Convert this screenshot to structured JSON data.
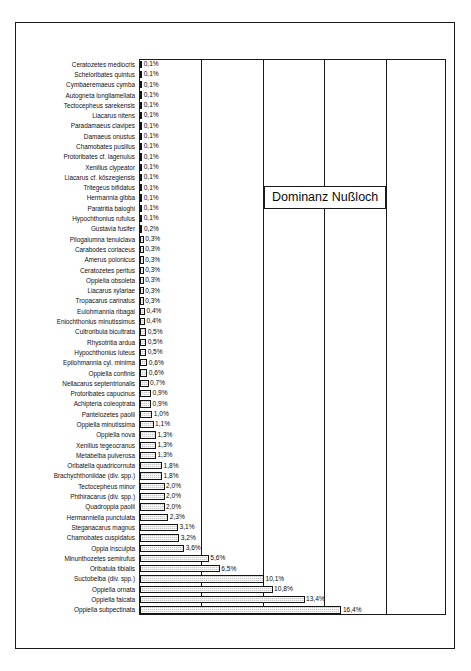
{
  "figure": {
    "title": "Dominanz Nußloch",
    "caption": ""
  },
  "chart_data": {
    "type": "bar",
    "orientation": "horizontal",
    "title": "Dominanz Nußloch",
    "xlabel": "",
    "ylabel": "",
    "xlim": [
      0,
      25
    ],
    "xticks": [
      0,
      5,
      10,
      15,
      20,
      25
    ],
    "grid": true,
    "legend": false,
    "value_suffix": "%",
    "decimal_separator": ",",
    "categories": [
      "Ceratozetes mediocris",
      "Scheloribates quintus",
      "Cymbaeremaeus cymba",
      "Autogneta longilamellata",
      "Tectocepheus sarekensis",
      "Liacarus nitens",
      "Paradamaeus clavipes",
      "Damaeus onustus",
      "Chamobates pusillus",
      "Protoribates cf. lagenulus",
      "Xenillus clypeator",
      "Liacarus cf. kőszegiensis",
      "Tritegeus bifidatus",
      "Hermannia gibba",
      "Paratritia baloghi",
      "Hypochthonius rufulus",
      "Gustavia fusifer",
      "Pilogalumna tenuiclava",
      "Carabodes coriaceus",
      "Amerus polonicus",
      "Ceratozetes peritus",
      "Oppiella obsoleta",
      "Liacarus xylariae",
      "Tropacarus carinatus",
      "Eulohmannia ribagai",
      "Eniochthonius minutissimus",
      "Cultroribula bicultrata",
      "Rhysotritia ardua",
      "Hypochthonius luteus",
      "Epilohmannia cyl. minima",
      "Oppiella confinis",
      "Nellacarus septentrionalis",
      "Protoribates capucinus",
      "Achipteria coleoptrata",
      "Pantelozetes paolii",
      "Oppiella minutissima",
      "Oppiella nova",
      "Xenillus tegeocranus",
      "Metabelba pulverosa",
      "Oribatella quadricornuta",
      "Brachychthoniidae (div. spp.)",
      "Tectocepheus minor",
      "Phthiracarus (div. spp.)",
      "Quadroppia paolii",
      "Hermanniella punctulata",
      "Steganacarus magnus",
      "Chamobates cuspidatus",
      "Oppia insculpta",
      "Minunthozetes semirufus",
      "Oribatula tibialis",
      "Suctobelba (div. spp.)",
      "Oppiella ornata",
      "Oppiella falcata",
      "Oppiella subpectinata"
    ],
    "values": [
      0.1,
      0.1,
      0.1,
      0.1,
      0.1,
      0.1,
      0.1,
      0.1,
      0.1,
      0.1,
      0.1,
      0.1,
      0.1,
      0.1,
      0.1,
      0.1,
      0.2,
      0.3,
      0.3,
      0.3,
      0.3,
      0.3,
      0.3,
      0.3,
      0.4,
      0.4,
      0.5,
      0.5,
      0.5,
      0.6,
      0.6,
      0.7,
      0.9,
      0.9,
      1.0,
      1.1,
      1.3,
      1.3,
      1.3,
      1.8,
      1.8,
      2.0,
      2.0,
      2.0,
      2.3,
      3.1,
      3.2,
      3.6,
      5.6,
      6.5,
      10.1,
      10.8,
      13.4,
      16.4
    ],
    "value_labels": [
      "0,1%",
      "0,1%",
      "0,1%",
      "0,1%",
      "0,1%",
      "0,1%",
      "0,1%",
      "0,1%",
      "0,1%",
      "0,1%",
      "0,1%",
      "0,1%",
      "0,1%",
      "0,1%",
      "0,1%",
      "0,1%",
      "0,2%",
      "0,3%",
      "0,3%",
      "0,3%",
      "0,3%",
      "0,3%",
      "0,3%",
      "0,3%",
      "0,4%",
      "0,4%",
      "0,5%",
      "0,5%",
      "0,5%",
      "0,6%",
      "0,6%",
      "0,7%",
      "0,9%",
      "0,9%",
      "1,0%",
      "1,1%",
      "1,3%",
      "1,3%",
      "1,3%",
      "1,8%",
      "1,8%",
      "2,0%",
      "2,0%",
      "2,0%",
      "2,3%",
      "3,1%",
      "3,2%",
      "3,6%",
      "5,6%",
      "6,5%",
      "10,1%",
      "10,8%",
      "13,4%",
      "16,4%"
    ],
    "colors": {
      "bar_fill": "#c8c8c8",
      "bar_border": "#141414",
      "gridline": "#1a1a1a",
      "frame": "#1a1a1a",
      "text": "#0b0b0b",
      "background": "#ffffff"
    }
  }
}
